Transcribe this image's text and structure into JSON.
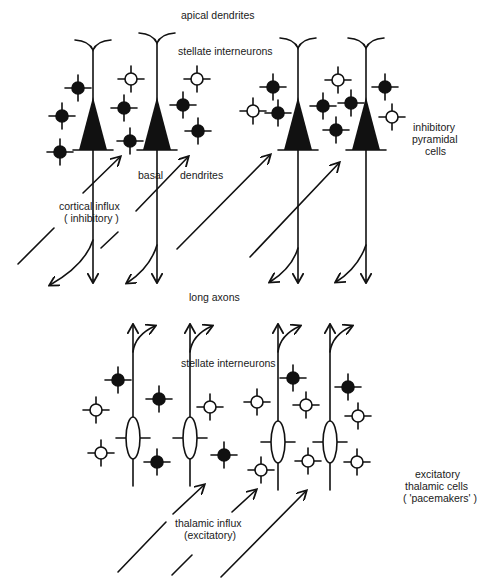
{
  "labels": {
    "apical_dendrites": "apical dendrites",
    "stellate_top": "stellate interneurons",
    "inhibitory_pyramidal": [
      "inhibitory",
      "pyramidal",
      "cells"
    ],
    "basal": "basal",
    "dendrites": "dendrites",
    "cortical_influx": [
      "cortical influx",
      "( inhibitory )"
    ],
    "long_axons": "long axons",
    "stellate_bottom": "stellate interneurons",
    "excitatory_thalamic": [
      "excitatory",
      "thalamic cells",
      "( 'pacemakers' )"
    ],
    "thalamic_influx": [
      "thalamic influx",
      "(excitatory)"
    ]
  },
  "colors": {
    "ink": "#111111",
    "background": "#ffffff"
  },
  "pyramidal_cells": [
    {
      "x": 93,
      "dendrite_top": 40
    },
    {
      "x": 157,
      "dendrite_top": 33
    },
    {
      "x": 298,
      "dendrite_top": 38
    },
    {
      "x": 366,
      "dendrite_top": 38
    }
  ],
  "top_stellates": [
    {
      "x": 78,
      "y": 88,
      "filled": true
    },
    {
      "x": 62,
      "y": 116,
      "filled": true
    },
    {
      "x": 60,
      "y": 152,
      "filled": true
    },
    {
      "x": 131,
      "y": 79,
      "filled": false
    },
    {
      "x": 124,
      "y": 108,
      "filled": true
    },
    {
      "x": 130,
      "y": 141,
      "filled": true
    },
    {
      "x": 197,
      "y": 79,
      "filled": false
    },
    {
      "x": 183,
      "y": 105,
      "filled": true
    },
    {
      "x": 198,
      "y": 131,
      "filled": true
    },
    {
      "x": 273,
      "y": 87,
      "filled": true
    },
    {
      "x": 253,
      "y": 111,
      "filled": false
    },
    {
      "x": 278,
      "y": 113,
      "filled": true
    },
    {
      "x": 323,
      "y": 106,
      "filled": true
    },
    {
      "x": 338,
      "y": 80,
      "filled": false
    },
    {
      "x": 351,
      "y": 103,
      "filled": true
    },
    {
      "x": 336,
      "y": 130,
      "filled": true
    },
    {
      "x": 385,
      "y": 87,
      "filled": true
    },
    {
      "x": 392,
      "y": 117,
      "filled": false
    }
  ],
  "thalamic_cells": [
    {
      "x": 133,
      "y": 438
    },
    {
      "x": 190,
      "y": 438
    },
    {
      "x": 278,
      "y": 442
    },
    {
      "x": 330,
      "y": 442
    }
  ],
  "bottom_stellates": [
    {
      "x": 118,
      "y": 380,
      "filled": true
    },
    {
      "x": 96,
      "y": 410,
      "filled": false
    },
    {
      "x": 159,
      "y": 399,
      "filled": true
    },
    {
      "x": 210,
      "y": 407,
      "filled": false
    },
    {
      "x": 101,
      "y": 453,
      "filled": false
    },
    {
      "x": 157,
      "y": 462,
      "filled": true
    },
    {
      "x": 224,
      "y": 455,
      "filled": true
    },
    {
      "x": 257,
      "y": 402,
      "filled": false
    },
    {
      "x": 293,
      "y": 378,
      "filled": true
    },
    {
      "x": 306,
      "y": 405,
      "filled": false
    },
    {
      "x": 348,
      "y": 387,
      "filled": true
    },
    {
      "x": 358,
      "y": 416,
      "filled": false
    },
    {
      "x": 261,
      "y": 470,
      "filled": false
    },
    {
      "x": 308,
      "y": 461,
      "filled": false
    },
    {
      "x": 357,
      "y": 462,
      "filled": false
    }
  ]
}
